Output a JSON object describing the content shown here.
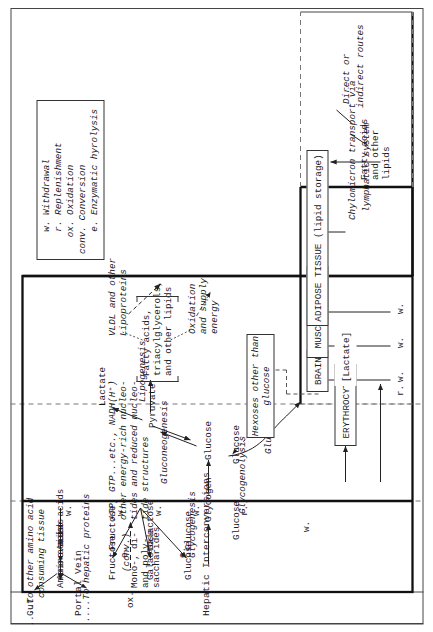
{
  "figure": {
    "title_hidden": "Metabolic interconversions: Gut, Portal Vein, Hepatic Interconversions and peripheral tissues"
  },
  "bands": {
    "gut": "Gut",
    "portal_vein": "Portal Vein",
    "hepatic": "Hepatic Interconversions"
  },
  "gut": {
    "amino_acids": "Amino acids",
    "mono_di_poly": "Mono-, di-\nand poly-\nsaccharides",
    "fatty_acids": "Fatty acids\nand other\nlipids",
    "e_label_1": "e.",
    "e_label_2": "e."
  },
  "portal": {
    "amino_acids": "Amino acids",
    "fructose": "Fructose",
    "galactose": "Galactose",
    "glucose": "Glucose",
    "glucose2": "Glucose",
    "w_label": "w."
  },
  "hepatic": {
    "amino_acids": "Amino acids",
    "fructose": "Fructose",
    "galactose": "Galactose",
    "glucose": "Glucose",
    "glucose_mid": "Glucose",
    "glucose_right": "Glucose",
    "glycogen": "Glycogen",
    "pyruvate": "Pyruvate",
    "lactate": "Lactate",
    "conv": "(conv.)",
    "ox": "ox.",
    "glycogenesis": "Glycogenesis",
    "glycogenolysis": "Glycogenolysis",
    "gluconeogenesis_1": "Gluconeogenesis",
    "gluconeogenesis_2": "Gluconeogenesis",
    "gluconeogenesis_3": "Gluconeogenesis",
    "lipogenesis": "Lipogenesis",
    "w1": "w.",
    "w2": "w.",
    "w3": "w.",
    "w4": "w.",
    "w5": "w.",
    "r1": "r.",
    "r2": "r.",
    "to_other_amino": "....To other amino acid\n     consuming tissue",
    "to_hepatic_proteins": "....To hepatic proteins",
    "nucleotides": "ATP, GTP...etc., NADH(H⁺)\nother energy-rich nucleo-\ntides and reduced nucleo-\ntide structures",
    "lipids_bracket": "Fatty acids,\ntriacylglycerols,\nand other lipids",
    "vldl": "VLDL and other\nLipoproteins",
    "oxidation_supply": "Oxidation\nand supply\nenergy",
    "hexoses_box": "Hexoses other than\nglucose",
    "erythrocytes_box": "ERYTHROCYTES",
    "lactate_box": "[Lactate]"
  },
  "tissues": {
    "brain": "BRAIN",
    "muscle": "MUSCLE TISSUE",
    "adipose": "ADIPOSE TISSUE (lipid storage)",
    "w_brain": "w.",
    "w_muscle": "w.",
    "w_adipose": "w.",
    "r_brain": "r."
  },
  "chylomicron": {
    "transport": "Chylomicron transport via",
    "lymphatic": "lymphatic system",
    "direct": "Direct or",
    "indirect": "indirect routes"
  },
  "legend": {
    "items": [
      "w. Withdrawal",
      "r. Replenishment",
      "ox. Oxidation",
      "conv. Conversion",
      "e. Enzymatic hyrolysis"
    ],
    "text": "    w. Withdrawal\n    r. Replenishment\n   ox. Oxidation\nconv. Conversion\n    e. Enzymatic hyrolysis"
  },
  "colors": {
    "ink": "#1a1a1a",
    "rule": "#3b3b3b",
    "paper": "#ffffff"
  }
}
